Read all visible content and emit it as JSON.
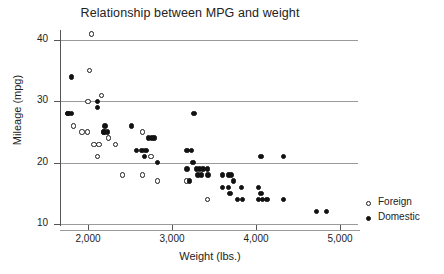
{
  "chart_data": {
    "type": "scatter",
    "title": "Relationship between MPG and weight",
    "xlabel": "Weight (lbs.)",
    "ylabel": "Mileage (mpg)",
    "xlim": [
      1700,
      5150
    ],
    "ylim": [
      9,
      42
    ],
    "xticks": [
      2000,
      3000,
      4000,
      5000
    ],
    "xtick_labels": [
      "2,000",
      "3,000",
      "4,000",
      "5,000"
    ],
    "yticks": [
      10,
      20,
      30,
      40
    ],
    "ytick_labels": [
      "10",
      "20",
      "30",
      "40"
    ],
    "grid": "horizontal",
    "legend_position": "right",
    "series": [
      {
        "name": "Foreign",
        "marker": "open-circle",
        "color": "#1c1c1c",
        "points": [
          [
            2040,
            41
          ],
          [
            2020,
            35
          ],
          [
            2000,
            30
          ],
          [
            2160,
            31
          ],
          [
            1760,
            28
          ],
          [
            1830,
            26
          ],
          [
            1930,
            25
          ],
          [
            1990,
            25
          ],
          [
            2070,
            23
          ],
          [
            2130,
            23
          ],
          [
            2190,
            25
          ],
          [
            2240,
            24
          ],
          [
            2110,
            21
          ],
          [
            2330,
            23
          ],
          [
            2650,
            25
          ],
          [
            2750,
            21
          ],
          [
            2410,
            18
          ],
          [
            2650,
            18
          ],
          [
            2830,
            17
          ],
          [
            3170,
            17
          ],
          [
            3420,
            14
          ]
        ]
      },
      {
        "name": "Domestic",
        "marker": "filled-circle",
        "color": "#121212",
        "points": [
          [
            1800,
            34
          ],
          [
            1760,
            28
          ],
          [
            1800,
            28
          ],
          [
            2110,
            30
          ],
          [
            2110,
            29
          ],
          [
            2200,
            26
          ],
          [
            2190,
            25
          ],
          [
            2230,
            25
          ],
          [
            2520,
            26
          ],
          [
            2580,
            22
          ],
          [
            2640,
            22
          ],
          [
            2690,
            22
          ],
          [
            2670,
            21
          ],
          [
            2720,
            24
          ],
          [
            2760,
            24
          ],
          [
            2790,
            24
          ],
          [
            2830,
            20
          ],
          [
            3260,
            28
          ],
          [
            3180,
            22
          ],
          [
            3230,
            22
          ],
          [
            3250,
            20
          ],
          [
            3180,
            19
          ],
          [
            3290,
            19
          ],
          [
            3330,
            19
          ],
          [
            3370,
            19
          ],
          [
            3420,
            19
          ],
          [
            3310,
            18
          ],
          [
            3350,
            18
          ],
          [
            3430,
            18
          ],
          [
            3210,
            17
          ],
          [
            3600,
            18
          ],
          [
            3670,
            18
          ],
          [
            3700,
            18
          ],
          [
            3730,
            17
          ],
          [
            3600,
            16
          ],
          [
            3670,
            16
          ],
          [
            3690,
            15
          ],
          [
            3830,
            16
          ],
          [
            4030,
            16
          ],
          [
            4060,
            15
          ],
          [
            3780,
            14
          ],
          [
            3840,
            14
          ],
          [
            4030,
            14
          ],
          [
            4080,
            14
          ],
          [
            4130,
            14
          ],
          [
            4330,
            14
          ],
          [
            4060,
            21
          ],
          [
            4330,
            21
          ],
          [
            4720,
            12
          ],
          [
            4840,
            12
          ]
        ]
      }
    ]
  }
}
